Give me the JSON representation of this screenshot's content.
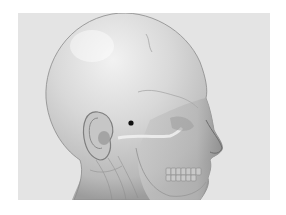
{
  "figure": {
    "rendering": "translucent skin over skull",
    "background_color": "#e4e4e4",
    "page_color": "#ffffff",
    "skin_color": "#d2d2d2",
    "marker": {
      "label": "point-marker",
      "x": 131,
      "y": 123,
      "radius": 2.6,
      "color": "#111111"
    }
  }
}
